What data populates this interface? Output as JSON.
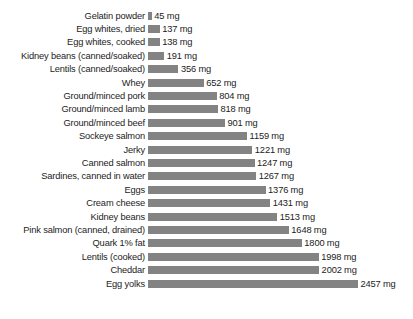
{
  "chart_data": {
    "type": "bar",
    "orientation": "horizontal",
    "title": "",
    "subtitle": "",
    "xlabel": "",
    "ylabel": "",
    "unit": "mg",
    "grid": false,
    "legend": false,
    "axis_visible": false,
    "xlim": [
      0,
      2457
    ],
    "bar_color": "#838383",
    "categories": [
      "Gelatin powder",
      "Egg whites, dried",
      "Egg whites, cooked",
      "Kidney beans (canned/soaked)",
      "Lentils (canned/soaked)",
      "Whey",
      "Ground/minced pork",
      "Ground/minced lamb",
      "Ground/minced beef",
      "Sockeye salmon",
      "Jerky",
      "Canned salmon",
      "Sardines, canned in water",
      "Eggs",
      "Cream cheese",
      "Kidney beans",
      "Pink salmon (canned, drained)",
      "Quark 1% fat",
      "Lentils (cooked)",
      "Cheddar",
      "Egg yolks"
    ],
    "values": [
      45,
      137,
      138,
      191,
      356,
      652,
      804,
      818,
      901,
      1159,
      1221,
      1247,
      1267,
      1376,
      1431,
      1513,
      1648,
      1800,
      1998,
      2002,
      2457
    ],
    "value_labels": [
      "45 mg",
      "137 mg",
      "138 mg",
      "191 mg",
      "356 mg",
      "652 mg",
      "804 mg",
      "818 mg",
      "901 mg",
      "1159 mg",
      "1221 mg",
      "1247 mg",
      "1267 mg",
      "1376 mg",
      "1431 mg",
      "1513 mg",
      "1648 mg",
      "1800 mg",
      "1998 mg",
      "2002 mg",
      "2457 mg"
    ]
  }
}
